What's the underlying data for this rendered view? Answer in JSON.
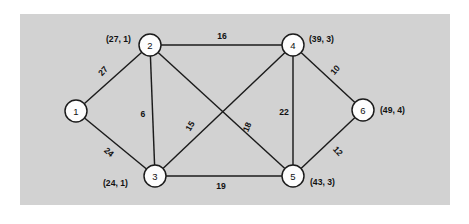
{
  "figure": {
    "kind": "weighted-undirected-graph",
    "panel_color": "#d2d2d2",
    "background_color": "#ffffff",
    "node_fill": "#fdfdfd",
    "stroke_color": "#1b1b1b"
  },
  "graph_data": {
    "type": "diagram",
    "title": "",
    "nodes": [
      {
        "id": "1",
        "label": "1",
        "tuple": "",
        "x": 76,
        "y": 111,
        "r": 11,
        "tuple_x": 0,
        "tuple_y": 0,
        "tuple_anchor": "start"
      },
      {
        "id": "2",
        "label": "2",
        "tuple": "(27, 1)",
        "x": 150,
        "y": 45,
        "r": 11,
        "tuple_x": 106,
        "tuple_y": 39,
        "tuple_anchor": "start"
      },
      {
        "id": "3",
        "label": "3",
        "tuple": "(24, 1)",
        "x": 155,
        "y": 176,
        "r": 11,
        "tuple_x": 103,
        "tuple_y": 183,
        "tuple_anchor": "start"
      },
      {
        "id": "4",
        "label": "4",
        "tuple": "(39, 3)",
        "x": 293,
        "y": 45,
        "r": 11,
        "tuple_x": 309,
        "tuple_y": 39,
        "tuple_anchor": "start"
      },
      {
        "id": "5",
        "label": "5",
        "tuple": "(43, 3)",
        "x": 293,
        "y": 176,
        "r": 11,
        "tuple_x": 310,
        "tuple_y": 182,
        "tuple_anchor": "start"
      },
      {
        "id": "6",
        "label": "6",
        "tuple": "(49, 4)",
        "x": 363,
        "y": 110,
        "r": 11,
        "tuple_x": 380,
        "tuple_y": 110,
        "tuple_anchor": "start"
      }
    ],
    "edges": [
      {
        "from": "1",
        "to": "2",
        "weight": "27",
        "label_x": 103,
        "label_y": 71,
        "rotate": -48
      },
      {
        "from": "1",
        "to": "3",
        "weight": "24",
        "label_x": 109,
        "label_y": 152,
        "rotate": 41
      },
      {
        "from": "2",
        "to": "4",
        "weight": "16",
        "label_x": 222,
        "label_y": 36,
        "rotate": 0
      },
      {
        "from": "2",
        "to": "3",
        "weight": "6",
        "label_x": 143,
        "label_y": 114,
        "rotate": 0
      },
      {
        "from": "2",
        "to": "5",
        "weight": "18",
        "label_x": 247,
        "label_y": 127,
        "rotate": -67
      },
      {
        "from": "3",
        "to": "4",
        "weight": "15",
        "label_x": 190,
        "label_y": 126,
        "rotate": -58
      },
      {
        "from": "3",
        "to": "5",
        "weight": "19",
        "label_x": 221,
        "label_y": 186,
        "rotate": 0
      },
      {
        "from": "4",
        "to": "5",
        "weight": "22",
        "label_x": 284,
        "label_y": 112,
        "rotate": 0
      },
      {
        "from": "4",
        "to": "6",
        "weight": "10",
        "label_x": 335,
        "label_y": 70,
        "rotate": -49
      },
      {
        "from": "5",
        "to": "6",
        "weight": "12",
        "label_x": 338,
        "label_y": 151,
        "rotate": 48
      }
    ]
  }
}
